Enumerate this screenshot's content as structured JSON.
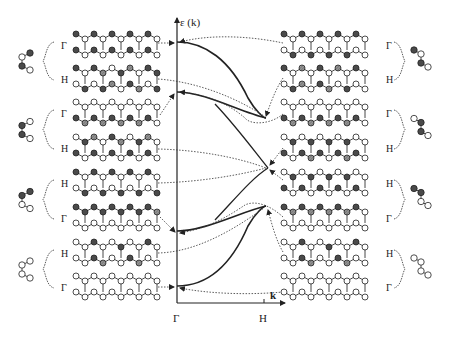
{
  "figure": {
    "type": "band-structure-orbital-diagram",
    "axis": {
      "y_label": "ε (k)",
      "x_label": "k",
      "x_ticks": [
        "Γ",
        "H"
      ]
    },
    "colors": {
      "line": "#222222",
      "filled_atom": "#555555",
      "hatched_atom": "#8a8a8a",
      "open_atom": "#ffffff",
      "background": "#ffffff"
    },
    "left_groups": [
      {
        "labels": [
          "Γ",
          "H"
        ],
        "motif": [
          "filled",
          "open",
          "filled",
          "open"
        ]
      },
      {
        "labels": [
          "Γ",
          "H"
        ],
        "motif": [
          "open",
          "filled",
          "filled",
          "open"
        ]
      },
      {
        "labels": [
          "H",
          "Γ"
        ],
        "motif": [
          "filled",
          "filled",
          "open",
          "open"
        ]
      },
      {
        "labels": [
          "H",
          "Γ"
        ],
        "motif": [
          "open",
          "open",
          "open",
          "open"
        ]
      }
    ],
    "right_groups": [
      {
        "labels": [
          "Γ",
          "H"
        ],
        "motif": [
          "filled",
          "open",
          "filled",
          "open"
        ]
      },
      {
        "labels": [
          "Γ",
          "H"
        ],
        "motif": [
          "open",
          "filled",
          "filled",
          "open"
        ]
      },
      {
        "labels": [
          "H",
          "Γ"
        ],
        "motif": [
          "filled",
          "filled",
          "open",
          "open"
        ]
      },
      {
        "labels": [
          "H",
          "Γ"
        ],
        "motif": [
          "open",
          "open",
          "open",
          "open"
        ]
      }
    ],
    "left_row_labels": [
      "Γ",
      "H",
      "Γ",
      "H",
      "H",
      "Γ",
      "H",
      "Γ"
    ],
    "right_row_labels": [
      "Γ",
      "H",
      "Γ",
      "H",
      "H",
      "Γ",
      "H",
      "Γ"
    ],
    "bands": [
      {
        "name": "band-1",
        "start_gamma": 0.95,
        "end_H": 0.35
      },
      {
        "name": "band-2",
        "start_gamma": 0.72,
        "end_H": 0.36
      },
      {
        "name": "band-3",
        "start_gamma": 0.28,
        "end_H": 0.64
      },
      {
        "name": "band-4",
        "start_gamma": 0.05,
        "end_H": 0.65
      }
    ]
  }
}
